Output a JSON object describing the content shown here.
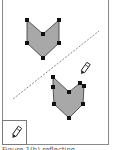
{
  "figure": {
    "colors": {
      "shape_fill": "#a8a8a8",
      "shape_stroke": "#333333",
      "vertex": "#111111",
      "mirror_line": "#888888",
      "frame": "#8a8a8a"
    },
    "original_shape": {
      "vertices": [
        [
          27,
          20
        ],
        [
          43,
          34
        ],
        [
          59,
          20
        ],
        [
          59,
          43
        ],
        [
          43,
          58
        ],
        [
          27,
          43
        ]
      ]
    },
    "reflected_shape": {
      "vertices": [
        [
          53,
          77
        ],
        [
          53,
          87
        ],
        [
          54,
          104
        ],
        [
          69,
          118
        ],
        [
          83,
          104
        ],
        [
          84,
          86
        ],
        [
          80,
          83
        ],
        [
          69,
          92
        ]
      ]
    },
    "mirror_line": {
      "x1": 13,
      "y1": 99,
      "x2": 99,
      "y2": 31,
      "style": "dashed"
    },
    "tools": {
      "pencil_on_canvas": "pencil-icon",
      "tool_box_icon": "pencil-icon"
    },
    "caption": "Figure 1(b)  reflection"
  }
}
